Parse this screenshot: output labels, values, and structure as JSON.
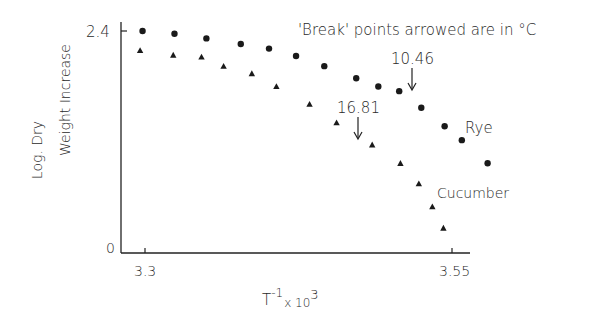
{
  "chart_data": {
    "type": "scatter",
    "title": "",
    "annotation": "'Break' points arrowed are in °C",
    "xlabel": "T^-1 x 10^3",
    "ylabel": "Log. Dry Weight Increase",
    "ylabel_lines": [
      "Log. Dry",
      "Weight Increase"
    ],
    "xlim": [
      3.28,
      3.565
    ],
    "ylim": [
      0,
      2.4
    ],
    "x_ticks": [
      3.3,
      3.55
    ],
    "x_tick_labels": [
      "3.3",
      "3.55"
    ],
    "y_ticks": [
      0,
      2.4
    ],
    "y_tick_labels": [
      "0",
      "2.4"
    ],
    "grid": false,
    "legend": "none (series labeled inline)",
    "series": [
      {
        "name": "Rye",
        "marker": "circle",
        "x": [
          3.298,
          3.324,
          3.35,
          3.378,
          3.401,
          3.423,
          3.446,
          3.472,
          3.49,
          3.507,
          3.525,
          3.544,
          3.558,
          3.579
        ],
        "y": [
          2.4,
          2.37,
          2.32,
          2.26,
          2.21,
          2.13,
          2.02,
          1.89,
          1.8,
          1.75,
          1.57,
          1.37,
          1.22,
          0.97
        ]
      },
      {
        "name": "Cucumber",
        "marker": "triangle",
        "x": [
          3.296,
          3.323,
          3.346,
          3.364,
          3.387,
          3.407,
          3.434,
          3.456,
          3.485,
          3.508,
          3.523,
          3.534,
          3.543
        ],
        "y": [
          2.19,
          2.14,
          2.12,
          2.02,
          1.94,
          1.8,
          1.61,
          1.41,
          1.17,
          0.97,
          0.75,
          0.5,
          0.27
        ]
      }
    ],
    "break_points": [
      {
        "series": "Rye",
        "label": "10.46",
        "x": 3.513,
        "unit": "°C"
      },
      {
        "series": "Cucumber",
        "label": "16.81",
        "x": 3.462,
        "unit": "°C"
      }
    ]
  },
  "text": {
    "annotation": "'Break' points arrowed are in °C",
    "y_tick_top": "2.4",
    "y_tick_bottom": "0",
    "x_tick_left": "3.3",
    "x_tick_right": "3.55",
    "ylabel_line1": "Log. Dry",
    "ylabel_line2": "Weight Increase",
    "xlabel_base": "T",
    "xlabel_exp": "-1",
    "xlabel_mult": "x 10",
    "xlabel_exp2": "3",
    "series_label_rye": "Rye",
    "series_label_cucumber": "Cucumber",
    "break_rye": "10.46",
    "break_cucumber": "16.81"
  }
}
